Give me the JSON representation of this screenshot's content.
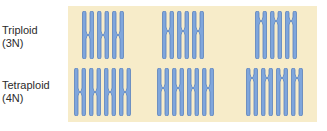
{
  "rows": [
    {
      "name": "triploid",
      "label_line1": "Triploid",
      "label_line2": "(3N)",
      "copies": 3
    },
    {
      "name": "tetraploid",
      "label_line1": "Tetraploid",
      "label_line2": "(4N)",
      "copies": 4
    }
  ],
  "chromosome_types": [
    "metacentric",
    "submetacentric",
    "acrocentric"
  ],
  "colors": {
    "panel_bg": "#f7ecc9",
    "chromosome_fill": "#7fa6dc",
    "chromosome_stroke": "#5b82bd",
    "text": "#2b2b2b"
  }
}
